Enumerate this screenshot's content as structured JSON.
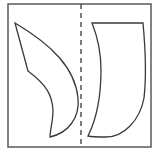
{
  "diagram": {
    "type": "symmetry-figure",
    "description": "Two curved shapes inside a square frame separated by a vertical dashed line",
    "colors": {
      "background": "#ffffff",
      "frame": "#5a5a5a",
      "stroke": "#3a3a3a",
      "fold_line": "#3a3a3a"
    },
    "frame": {
      "x": 8,
      "y": 4,
      "width": 143,
      "height": 143
    },
    "fold_line": {
      "x": 81,
      "y1": 4,
      "y2": 147,
      "style": "dashed"
    },
    "shapes": [
      {
        "name": "left-shape",
        "path": "M15,23 L28,71 C48,86 52,96 53,110 C53,122 50,130 50,137 C68,133 80,118 78,98 C75,68 52,45 15,23 Z"
      },
      {
        "name": "right-shape",
        "path": "M92,23 L143,23 C146,55 146,80 144,98 C140,120 124,137 106,137 C98,137 92,137 88,136 C97,118 101,95 101,70 C101,52 98,38 92,23 Z"
      }
    ]
  }
}
